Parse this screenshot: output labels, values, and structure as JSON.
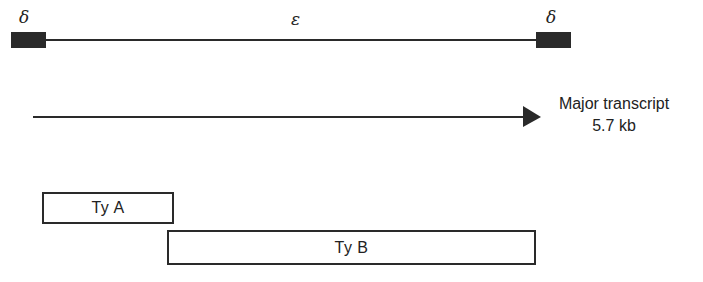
{
  "diagram": {
    "element": {
      "ltr_left_label": "δ",
      "internal_label": "ε",
      "ltr_right_label": "δ"
    },
    "transcript": {
      "label_line1": "Major transcript",
      "label_line2": "5.7 kb"
    },
    "orfs": [
      {
        "label": "Ty A"
      },
      {
        "label": "Ty B"
      }
    ],
    "colors": {
      "ink": "#2a2a2a",
      "background": "#ffffff"
    }
  }
}
